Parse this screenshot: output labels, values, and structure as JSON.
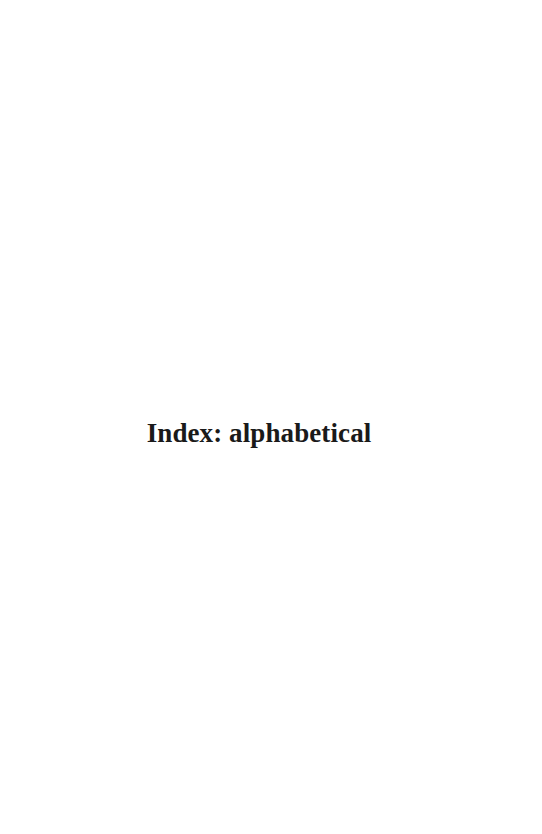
{
  "page": {
    "kind": "book-section-divider-page",
    "background_color": "#ffffff",
    "width": 542,
    "height": 834
  },
  "heading": {
    "text": "Index: alphabetical",
    "color": "#1a1a1a",
    "weight": "bold",
    "style": "serif"
  }
}
